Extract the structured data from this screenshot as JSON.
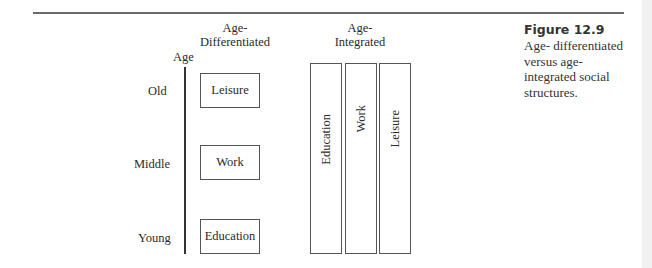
{
  "figure": {
    "number_label": "Figure 12.9",
    "caption_lines": [
      "Age- differentiated",
      "versus age-",
      "integrated social",
      "structures."
    ]
  },
  "diagram": {
    "axis_label": "Age",
    "age_levels": [
      "Old",
      "Middle",
      "Young"
    ],
    "age_differentiated": {
      "heading_lines": [
        "Age-",
        "Differentiated"
      ],
      "boxes": [
        "Leisure",
        "Work",
        "Education"
      ]
    },
    "age_integrated": {
      "heading_lines": [
        "Age-",
        "Integrated"
      ],
      "columns": [
        "Education",
        "Work",
        "Leisure"
      ]
    }
  },
  "colors": {
    "line": "#555555",
    "rule": "#6a6a6a",
    "text": "#2a2a2a"
  }
}
